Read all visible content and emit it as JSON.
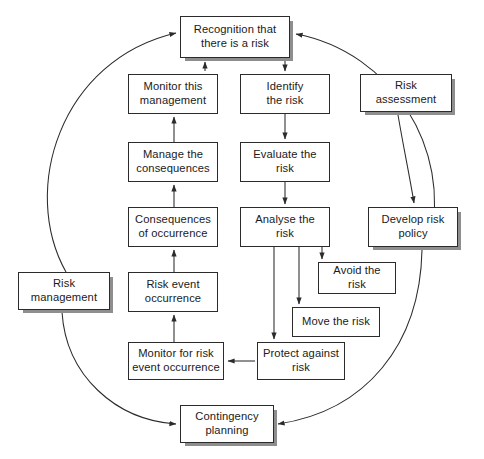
{
  "diagram": {
    "type": "flowchart",
    "background_color": "#ffffff",
    "box_border_color": "#2b2b2b",
    "box_fill_color": "#ffffff",
    "shadow_color": "#8e8e8e",
    "nodes": [
      {
        "id": "recognition",
        "label": "Recognition that\nthere is a risk",
        "x": 180,
        "y": 16,
        "w": 110,
        "h": 42,
        "shadow": true
      },
      {
        "id": "monitor-mgmt",
        "label": "Monitor this\nmanagement",
        "x": 128,
        "y": 74,
        "w": 90,
        "h": 40,
        "shadow": false
      },
      {
        "id": "identify",
        "label": "Identify\nthe risk",
        "x": 240,
        "y": 74,
        "w": 90,
        "h": 40,
        "shadow": false
      },
      {
        "id": "risk-assessment",
        "label": "Risk\nassessment",
        "x": 360,
        "y": 74,
        "w": 92,
        "h": 38,
        "shadow": true
      },
      {
        "id": "manage-conseq",
        "label": "Manage the\nconsequences",
        "x": 128,
        "y": 142,
        "w": 90,
        "h": 40,
        "shadow": false
      },
      {
        "id": "evaluate",
        "label": "Evaluate the\nrisk",
        "x": 240,
        "y": 142,
        "w": 90,
        "h": 40,
        "shadow": false
      },
      {
        "id": "consequences",
        "label": "Consequences\nof occurrence",
        "x": 128,
        "y": 207,
        "w": 90,
        "h": 40,
        "shadow": false
      },
      {
        "id": "analyse",
        "label": "Analyse the\nrisk",
        "x": 240,
        "y": 207,
        "w": 90,
        "h": 40,
        "shadow": false
      },
      {
        "id": "develop-policy",
        "label": "Develop risk\npolicy",
        "x": 368,
        "y": 207,
        "w": 90,
        "h": 40,
        "shadow": true
      },
      {
        "id": "risk-event",
        "label": "Risk event\noccurrence",
        "x": 128,
        "y": 272,
        "w": 90,
        "h": 40,
        "shadow": false
      },
      {
        "id": "avoid",
        "label": "Avoid the\nrisk",
        "x": 318,
        "y": 262,
        "w": 78,
        "h": 32,
        "shadow": false
      },
      {
        "id": "risk-management",
        "label": "Risk\nmanagement",
        "x": 18,
        "y": 272,
        "w": 92,
        "h": 38,
        "shadow": true
      },
      {
        "id": "move",
        "label": "Move the risk",
        "x": 292,
        "y": 307,
        "w": 88,
        "h": 30,
        "shadow": false
      },
      {
        "id": "monitor-event",
        "label": "Monitor for risk\nevent occurrence",
        "x": 128,
        "y": 342,
        "w": 96,
        "h": 38,
        "shadow": false
      },
      {
        "id": "protect",
        "label": "Protect against\nrisk",
        "x": 257,
        "y": 342,
        "w": 88,
        "h": 38,
        "shadow": false
      },
      {
        "id": "contingency",
        "label": "Contingency\nplanning",
        "x": 180,
        "y": 405,
        "w": 94,
        "h": 38,
        "shadow": true
      }
    ],
    "connections": [
      {
        "from": "recognition",
        "to": "identify",
        "style": "solid",
        "shape": "straight"
      },
      {
        "from": "identify",
        "to": "evaluate",
        "style": "solid",
        "shape": "straight"
      },
      {
        "from": "evaluate",
        "to": "analyse",
        "style": "solid",
        "shape": "straight"
      },
      {
        "from": "analyse",
        "to": "avoid",
        "style": "solid",
        "shape": "orthogonal"
      },
      {
        "from": "analyse",
        "to": "move",
        "style": "solid",
        "shape": "orthogonal"
      },
      {
        "from": "analyse",
        "to": "protect",
        "style": "solid",
        "shape": "orthogonal"
      },
      {
        "from": "protect",
        "to": "monitor-event",
        "style": "solid",
        "shape": "straight"
      },
      {
        "from": "monitor-event",
        "to": "risk-event",
        "style": "solid",
        "shape": "straight"
      },
      {
        "from": "risk-event",
        "to": "consequences",
        "style": "solid",
        "shape": "straight"
      },
      {
        "from": "consequences",
        "to": "manage-conseq",
        "style": "solid",
        "shape": "straight"
      },
      {
        "from": "manage-conseq",
        "to": "monitor-mgmt",
        "style": "solid",
        "shape": "straight"
      },
      {
        "from": "monitor-mgmt",
        "to": "recognition",
        "style": "dashed",
        "shape": "straight"
      },
      {
        "from": "risk-assessment",
        "to": "develop-policy",
        "style": "solid",
        "shape": "curve"
      },
      {
        "from": "risk-management",
        "to": "recognition",
        "style": "solid",
        "shape": "arc"
      },
      {
        "from": "risk-management",
        "to": "contingency",
        "style": "solid",
        "shape": "arc"
      },
      {
        "from": "develop-policy",
        "to": "contingency",
        "style": "solid",
        "shape": "arc",
        "direction": "reverse"
      },
      {
        "from": "contingency",
        "to": "recognition",
        "style": "solid",
        "shape": "arc"
      }
    ],
    "groups": {
      "risk_assessment_label": "Risk assessment",
      "risk_management_label": "Risk management"
    }
  }
}
